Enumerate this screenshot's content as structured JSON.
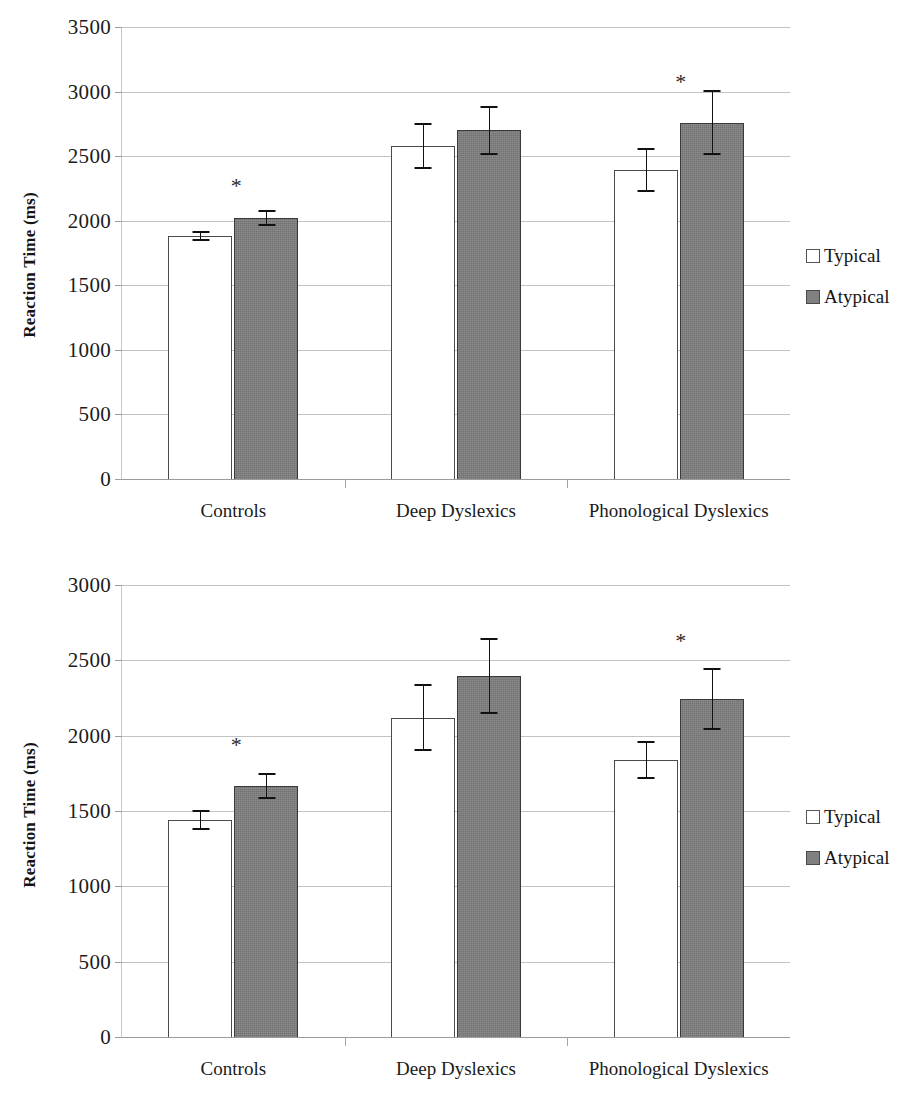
{
  "figure": {
    "panels": [
      {
        "id": "top",
        "ylabel": "Reaction Time (ms)",
        "legend": {
          "items": [
            "Typical",
            "Atypical"
          ]
        }
      },
      {
        "id": "bottom",
        "ylabel": "Reaction Time (ms)",
        "legend": {
          "items": [
            "Typical",
            "Atypical"
          ]
        }
      }
    ],
    "colors": {
      "typical_fill": "#ffffff",
      "atypical_fill": "#7e7e7e",
      "bar_outline": "#3a3a3a",
      "gridline": "#b9b9b9",
      "text": "#1a1a1a"
    }
  },
  "chart_data": [
    {
      "type": "bar",
      "id": "top-panel",
      "title": "",
      "xlabel": "",
      "ylabel": "Reaction Time (ms)",
      "ylim": [
        0,
        3500
      ],
      "yticks": [
        0,
        500,
        1000,
        1500,
        2000,
        2500,
        3000,
        3500
      ],
      "ytick_labels": [
        "0",
        "500",
        "1000",
        "1500",
        "2000",
        "2500",
        "3000",
        "3500"
      ],
      "grid": true,
      "legend_position": "right",
      "categories": [
        "Controls",
        "Deep Dyslexics",
        "Phonological Dyslexics"
      ],
      "series": [
        {
          "name": "Typical",
          "values": [
            1880,
            2580,
            2390
          ],
          "errors": [
            40,
            180,
            170
          ]
        },
        {
          "name": "Atypical",
          "values": [
            2020,
            2700,
            2760
          ],
          "errors": [
            60,
            190,
            250
          ]
        }
      ],
      "annotations": [
        {
          "text": "*",
          "category": "Controls",
          "y": 2260
        },
        {
          "text": "*",
          "category": "Phonological Dyslexics",
          "y": 3070
        }
      ]
    },
    {
      "type": "bar",
      "id": "bottom-panel",
      "title": "",
      "xlabel": "",
      "ylabel": "Reaction Time (ms)",
      "ylim": [
        0,
        3000
      ],
      "yticks": [
        0,
        500,
        1000,
        1500,
        2000,
        2500,
        3000
      ],
      "ytick_labels": [
        "0",
        "500",
        "1000",
        "1500",
        "2000",
        "2500",
        "3000"
      ],
      "grid": true,
      "legend_position": "right",
      "categories": [
        "Controls",
        "Deep Dyslexics",
        "Phonological Dyslexics"
      ],
      "series": [
        {
          "name": "Typical",
          "values": [
            1440,
            2120,
            1840
          ],
          "errors": [
            65,
            225,
            125
          ]
        },
        {
          "name": "Atypical",
          "values": [
            1665,
            2395,
            2245
          ],
          "errors": [
            85,
            250,
            205
          ]
        }
      ],
      "annotations": [
        {
          "text": "*",
          "category": "Controls",
          "y": 1930
        },
        {
          "text": "*",
          "category": "Phonological Dyslexics",
          "y": 2620
        }
      ]
    }
  ]
}
